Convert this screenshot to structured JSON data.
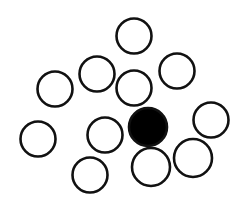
{
  "diagram": {
    "background": "#ffffff",
    "stroke_color": "#111111",
    "fill_color": "#000000",
    "stroke_width": 2.6,
    "circles": [
      {
        "cx": 134,
        "cy": 36,
        "r": 17.5,
        "filled": false
      },
      {
        "cx": 97,
        "cy": 74,
        "r": 17.5,
        "filled": false
      },
      {
        "cx": 55,
        "cy": 89,
        "r": 17.5,
        "filled": false
      },
      {
        "cx": 134,
        "cy": 88,
        "r": 17.5,
        "filled": false
      },
      {
        "cx": 177,
        "cy": 71,
        "r": 17.5,
        "filled": false
      },
      {
        "cx": 211,
        "cy": 120,
        "r": 17.5,
        "filled": false
      },
      {
        "cx": 148,
        "cy": 127,
        "r": 19,
        "filled": true
      },
      {
        "cx": 105,
        "cy": 135,
        "r": 17.5,
        "filled": false
      },
      {
        "cx": 38,
        "cy": 139,
        "r": 17.5,
        "filled": false
      },
      {
        "cx": 90,
        "cy": 175,
        "r": 17.5,
        "filled": false
      },
      {
        "cx": 151,
        "cy": 167,
        "r": 19,
        "filled": false
      },
      {
        "cx": 193,
        "cy": 158,
        "r": 19,
        "filled": false
      }
    ]
  }
}
